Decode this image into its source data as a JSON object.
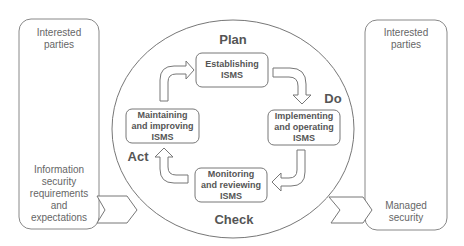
{
  "left_panel": {
    "top_label": "Interested\nparties",
    "bottom_label": "Information\nsecurity\nrequirements\nand\nexpectations"
  },
  "right_panel": {
    "top_label": "Interested\nparties",
    "bottom_label": "Managed\nsecurity"
  },
  "phases": {
    "plan": "Plan",
    "do": "Do",
    "check": "Check",
    "act": "Act"
  },
  "boxes": {
    "establishing": "Establishing\nISMS",
    "implementing": "Implementing\nand operating\nISMS",
    "monitoring": "Monitoring\nand reviewing\nISMS",
    "maintaining": "Maintaining\nand improving\nISMS"
  },
  "colors": {
    "stroke": "#777777",
    "text": "#555555",
    "background": "#ffffff"
  }
}
